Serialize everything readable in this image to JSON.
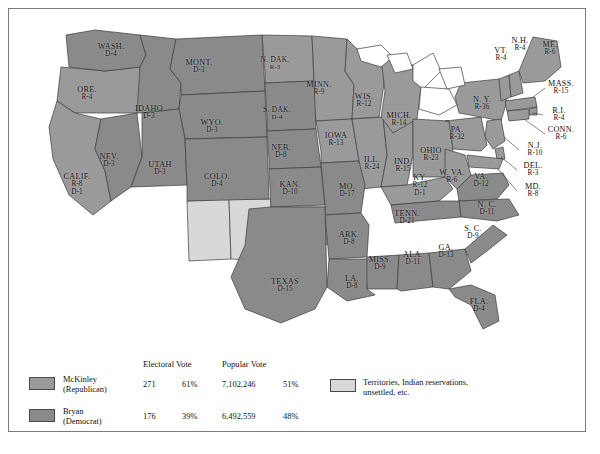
{
  "map": {
    "title": "Presidential Election of 1896",
    "colors": {
      "republican": "#9a9a9a",
      "democrat": "#8a8a8a",
      "territory": "#d8d8d8",
      "water": "#ffffff",
      "outline": "#3c3c3c",
      "frame": "#7a7a7a"
    },
    "states": [
      {
        "name": "WASH.",
        "votes": "D-4",
        "x": 102,
        "y": 42,
        "party": "D"
      },
      {
        "name": "ORE.",
        "votes": "R-4",
        "x": 78,
        "y": 85,
        "party": "R"
      },
      {
        "name": "IDAHO",
        "votes": "D-3",
        "x": 140,
        "y": 104,
        "party": "D"
      },
      {
        "name": "MONT.",
        "votes": "D-3",
        "x": 190,
        "y": 58,
        "party": "D"
      },
      {
        "name": "WYO.",
        "votes": "D-3",
        "x": 203,
        "y": 118,
        "party": "D"
      },
      {
        "name": "NEV.",
        "votes": "D-3",
        "x": 100,
        "y": 152,
        "party": "D"
      },
      {
        "name": "UTAH",
        "votes": "D-3",
        "x": 151,
        "y": 160,
        "party": "D"
      },
      {
        "name": "COLO.",
        "votes": "D-4",
        "x": 208,
        "y": 172,
        "party": "D"
      },
      {
        "name": "CALIF.",
        "votes": "R-8",
        "votes2": "D-1",
        "x": 68,
        "y": 176,
        "party": "R"
      },
      {
        "name": "N. DAK.",
        "votes": "R-3",
        "x": 266,
        "y": 54,
        "party": "R"
      },
      {
        "name": "S. DAK.",
        "votes": "D-4",
        "x": 268,
        "y": 104,
        "party": "D"
      },
      {
        "name": "NEB.",
        "votes": "D-8",
        "x": 272,
        "y": 143,
        "party": "D"
      },
      {
        "name": "KAN.",
        "votes": "D-10",
        "x": 281,
        "y": 180,
        "party": "D"
      },
      {
        "name": "MINN.",
        "votes": "R-9",
        "x": 310,
        "y": 80,
        "party": "R"
      },
      {
        "name": "IOWA",
        "votes": "R-13",
        "x": 327,
        "y": 131,
        "party": "R"
      },
      {
        "name": "MO.",
        "votes": "D-17",
        "x": 338,
        "y": 182,
        "party": "D"
      },
      {
        "name": "WIS.",
        "votes": "R-12",
        "x": 355,
        "y": 92,
        "party": "R"
      },
      {
        "name": "ILL.",
        "votes": "R-24",
        "x": 363,
        "y": 155,
        "party": "R"
      },
      {
        "name": "IND.",
        "votes": "R-15",
        "x": 394,
        "y": 157,
        "party": "R"
      },
      {
        "name": "MICH.",
        "votes": "R-14",
        "x": 390,
        "y": 111,
        "party": "R"
      },
      {
        "name": "OHIO",
        "votes": "R-23",
        "x": 422,
        "y": 146,
        "party": "R"
      },
      {
        "name": "KY.",
        "votes": "R-12",
        "votes2": "D-1",
        "x": 411,
        "y": 177,
        "party": "R"
      },
      {
        "name": "W. VA.",
        "votes": "R-6",
        "x": 443,
        "y": 168,
        "party": "R"
      },
      {
        "name": "VA.",
        "votes": "D-12",
        "x": 472,
        "y": 172,
        "party": "D"
      },
      {
        "name": "PA.",
        "votes": "R-32",
        "x": 448,
        "y": 125,
        "party": "R"
      },
      {
        "name": "N. Y.",
        "votes": "R-36",
        "x": 473,
        "y": 95,
        "party": "R"
      },
      {
        "name": "VT.",
        "votes": "R-4",
        "x": 492,
        "y": 46,
        "party": "R"
      },
      {
        "name": "N.H.",
        "votes": "R-4",
        "x": 511,
        "y": 36,
        "party": "R"
      },
      {
        "name": "ME.",
        "votes": "R-6",
        "x": 541,
        "y": 40,
        "party": "R"
      },
      {
        "name": "N. C.",
        "votes": "D-11",
        "x": 478,
        "y": 200,
        "party": "D"
      },
      {
        "name": "TENN.",
        "votes": "D-21",
        "x": 398,
        "y": 209,
        "party": "D"
      },
      {
        "name": "ARK.",
        "votes": "D-8",
        "x": 340,
        "y": 230,
        "party": "D"
      },
      {
        "name": "MISS.",
        "votes": "D-9",
        "x": 371,
        "y": 255,
        "party": "D"
      },
      {
        "name": "ALA.",
        "votes": "D-11",
        "x": 404,
        "y": 250,
        "party": "D"
      },
      {
        "name": "GA.",
        "votes": "D-13",
        "x": 437,
        "y": 243,
        "party": "D"
      },
      {
        "name": "S. C.",
        "votes": "D-9",
        "x": 464,
        "y": 224,
        "party": "D"
      },
      {
        "name": "LA.",
        "votes": "D-8",
        "x": 343,
        "y": 274,
        "party": "D"
      },
      {
        "name": "TEXAS",
        "votes": "D-15",
        "x": 276,
        "y": 277,
        "party": "D"
      },
      {
        "name": "FLA.",
        "votes": "D-4",
        "x": 470,
        "y": 297,
        "party": "D"
      }
    ],
    "callouts": [
      {
        "name": "MASS.",
        "votes": "R-15",
        "x": 552,
        "y": 79,
        "lx": 524,
        "ly": 88
      },
      {
        "name": "R.I.",
        "votes": "R-4",
        "x": 550,
        "y": 106,
        "lx": 523,
        "ly": 104
      },
      {
        "name": "CONN.",
        "votes": "R-6",
        "x": 552,
        "y": 125,
        "lx": 515,
        "ly": 110
      },
      {
        "name": "N.J.",
        "votes": "R-10",
        "x": 526,
        "y": 141,
        "lx": 495,
        "ly": 128
      },
      {
        "name": "DEL.",
        "votes": "R-3",
        "x": 524,
        "y": 161,
        "lx": 492,
        "ly": 148
      },
      {
        "name": "MD.",
        "votes": "R-8",
        "x": 524,
        "y": 182,
        "lx": 489,
        "ly": 160
      }
    ]
  },
  "legend": {
    "col_electoral": "Electoral Vote",
    "col_popular": "Popular Vote",
    "rows": [
      {
        "candidate_line1": "McKinley",
        "candidate_line2": "(Republican)",
        "electoral": "271",
        "electoral_pct": "61%",
        "popular": "7,102,246",
        "popular_pct": "51%",
        "swatch": "#9a9a9a"
      },
      {
        "candidate_line1": "Bryan",
        "candidate_line2": "(Democrat)",
        "electoral": "176",
        "electoral_pct": "39%",
        "popular": "6,492,559",
        "popular_pct": "48%",
        "swatch": "#8a8a8a"
      }
    ],
    "territory_line1": "Territories, Indian reservations,",
    "territory_line2": "unsettled, etc.",
    "territory_swatch": "#d8d8d8"
  }
}
